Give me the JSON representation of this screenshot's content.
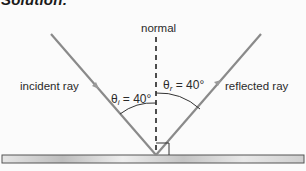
{
  "heading": "Solution:",
  "diagram": {
    "labels": {
      "normal": "normal",
      "incident_ray": "incident ray",
      "reflected_ray": "reflected ray"
    },
    "angles": {
      "incidence": {
        "symbol": "θ",
        "subscript": "i",
        "value": "= 40°"
      },
      "reflection": {
        "symbol": "θ",
        "subscript": "r",
        "value": "= 40°"
      }
    },
    "colors": {
      "ray": "#8a8a8a",
      "normal_line": "#222222",
      "mirror_fill": "#d8d8d8",
      "mirror_edge": "#555555",
      "arc": "#333333"
    }
  }
}
